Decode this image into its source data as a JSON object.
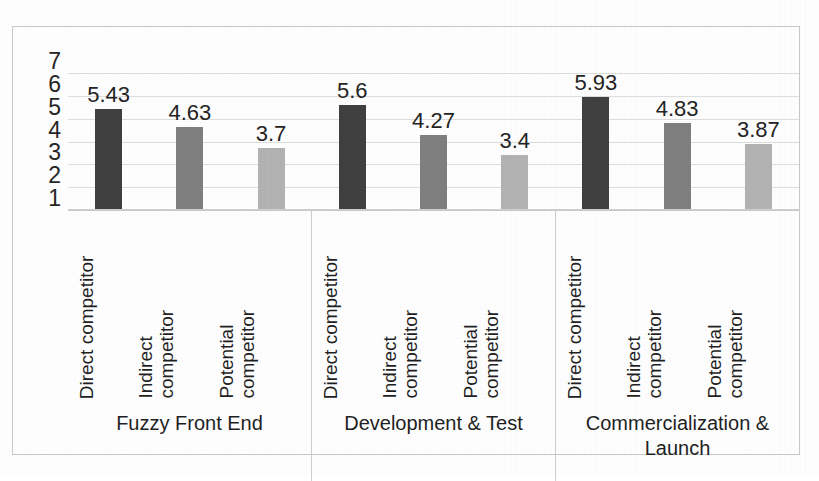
{
  "chart_data": {
    "type": "bar",
    "title": "",
    "xlabel": "",
    "ylabel": "",
    "ylim": [
      1,
      7
    ],
    "yticks": [
      7,
      6,
      5,
      4,
      3,
      2,
      1
    ],
    "grid": true,
    "legend": "none",
    "categories": [
      "Direct competitor",
      "Indirect competitor",
      "Potential competitor"
    ],
    "groups": [
      {
        "name": "Fuzzy Front End",
        "bars": [
          {
            "label": "Direct competitor",
            "value": 5.43,
            "value_text": "5.43",
            "color": "#404040"
          },
          {
            "label": "Indirect competitor",
            "value": 4.63,
            "value_text": "4.63",
            "color": "#7f7f7f"
          },
          {
            "label": "Potential competitor",
            "value": 3.7,
            "value_text": "3.7",
            "color": "#b3b3b3"
          }
        ]
      },
      {
        "name": "Development & Test",
        "bars": [
          {
            "label": "Direct competitor",
            "value": 5.6,
            "value_text": "5.6",
            "color": "#404040"
          },
          {
            "label": "Indirect competitor",
            "value": 4.27,
            "value_text": "4.27",
            "color": "#7f7f7f"
          },
          {
            "label": "Potential competitor",
            "value": 3.4,
            "value_text": "3.4",
            "color": "#b3b3b3"
          }
        ]
      },
      {
        "name": "Commercialization & Launch",
        "bars": [
          {
            "label": "Direct competitor",
            "value": 5.93,
            "value_text": "5.93",
            "color": "#404040"
          },
          {
            "label": "Indirect competitor",
            "value": 4.83,
            "value_text": "4.83",
            "color": "#7f7f7f"
          },
          {
            "label": "Potential competitor",
            "value": 3.87,
            "value_text": "3.87",
            "color": "#b3b3b3"
          }
        ]
      }
    ],
    "series": [
      {
        "name": "Direct competitor",
        "values": [
          5.43,
          5.6,
          5.93
        ]
      },
      {
        "name": "Indirect competitor",
        "values": [
          4.63,
          4.27,
          4.83
        ]
      },
      {
        "name": "Potential competitor",
        "values": [
          3.7,
          3.4,
          3.87
        ]
      }
    ],
    "colors": {
      "direct": "#404040",
      "indirect": "#7f7f7f",
      "potential": "#b3b3b3",
      "gridline": "#dedede",
      "frame": "#c9c9c9",
      "text": "#1f1f1f"
    }
  }
}
